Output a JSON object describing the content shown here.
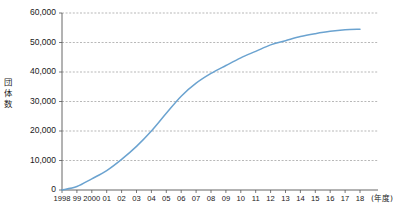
{
  "chart_data": {
    "type": "line",
    "title": "",
    "xlabel": "(年度)",
    "ylabel": "団体数",
    "ylabel_chars": [
      "団",
      "体",
      "数"
    ],
    "grid": true,
    "legend": "none",
    "ylim": [
      0,
      60000
    ],
    "ytick_labels": [
      "60,000",
      "50,000",
      "40,000",
      "30,000",
      "20,000",
      "10,000",
      "0"
    ],
    "ytick_values": [
      60000,
      50000,
      40000,
      30000,
      20000,
      10000,
      0
    ],
    "categories": [
      "1998",
      "99",
      "2000",
      "01",
      "02",
      "03",
      "04",
      "05",
      "06",
      "07",
      "08",
      "09",
      "10",
      "11",
      "12",
      "13",
      "14",
      "15",
      "16",
      "17",
      "18"
    ],
    "x_values": [
      1998,
      1999,
      2000,
      2001,
      2002,
      2003,
      2004,
      2005,
      2006,
      2007,
      2008,
      2009,
      2010,
      2011,
      2012,
      2013,
      2014,
      2015,
      2016,
      2017,
      2018
    ],
    "series": [
      {
        "name": "団体数",
        "color": "#6ba3d0",
        "values": [
          23,
          1176,
          3800,
          6600,
          10400,
          14800,
          20000,
          26000,
          31800,
          36200,
          39500,
          42200,
          44800,
          47000,
          49200,
          50600,
          52000,
          53000,
          53800,
          54300,
          54500
        ]
      }
    ]
  }
}
